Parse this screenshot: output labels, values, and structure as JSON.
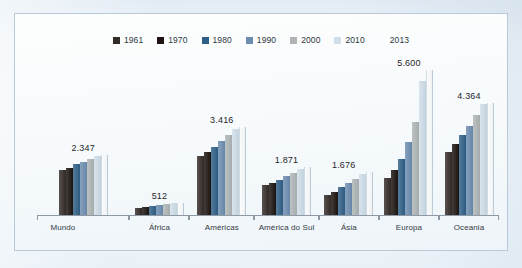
{
  "chart_data": {
    "type": "bar",
    "title": "",
    "xlabel": "",
    "ylabel": "",
    "grid": false,
    "legend_position": "top-center",
    "ylim": [
      0,
      6000
    ],
    "categories": [
      "Mundo",
      "África",
      "Américas",
      "América do Sul",
      "Ásia",
      "Europa",
      "Oceania"
    ],
    "series": [
      {
        "name": "1961",
        "color": "#332b28",
        "values": [
          1780,
          300,
          2290,
          1180,
          820,
          1460,
          2480
        ]
      },
      {
        "name": "1970",
        "color": "#1b1410",
        "values": [
          1860,
          330,
          2450,
          1270,
          940,
          1760,
          2760
        ]
      },
      {
        "name": "1980",
        "color": "#2f5f86",
        "values": [
          1990,
          370,
          2650,
          1400,
          1100,
          2180,
          3130
        ]
      },
      {
        "name": "1990",
        "color": "#6c8db0",
        "values": [
          2090,
          410,
          2880,
          1530,
          1270,
          2860,
          3470
        ]
      },
      {
        "name": "2000",
        "color": "#aeb5b4",
        "values": [
          2200,
          450,
          3100,
          1670,
          1430,
          3620,
          3880
        ]
      },
      {
        "name": "2010",
        "color": "#cfdee9",
        "values": [
          2310,
          495,
          3350,
          1820,
          1620,
          5180,
          4290
        ]
      },
      {
        "name": "2013",
        "color": "#f4f8fb",
        "values": [
          2347,
          512,
          3416,
          1871,
          1676,
          5600,
          4364
        ]
      }
    ],
    "data_labels": [
      "2.347",
      "512",
      "3.416",
      "1.871",
      "1.676",
      "5.600",
      "4.364"
    ]
  }
}
